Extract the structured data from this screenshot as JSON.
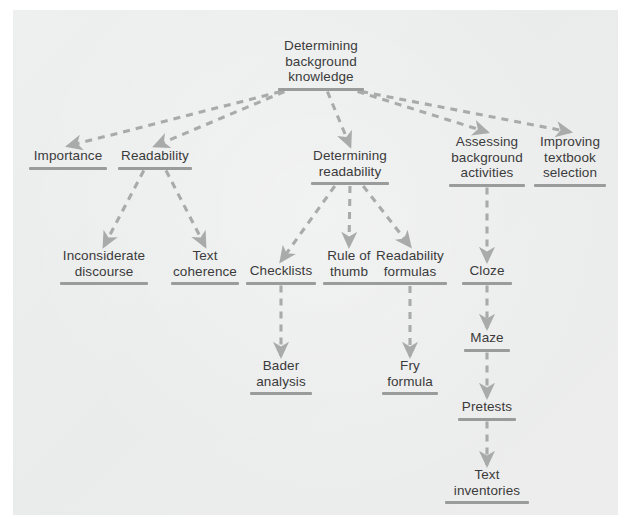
{
  "diagram": {
    "title_text": "Determining background knowledge",
    "type": "hierarchy-tree",
    "style": {
      "panel_bg": "#eceded",
      "page_bg": "#ffffff",
      "text_color": "#3b3b3b",
      "rule_color": "#9a9c9c",
      "connector_color": "#a9abab",
      "connector_style": "dashed-arrow"
    },
    "nodes": [
      {
        "id": "root",
        "label": "Determining\nbackground\nknowledge",
        "x": 321,
        "y": 38,
        "rule_w": 86
      },
      {
        "id": "importance",
        "label": "Importance",
        "x": 68,
        "y": 148,
        "rule_w": 78
      },
      {
        "id": "readability",
        "label": "Readability",
        "x": 155,
        "y": 148,
        "rule_w": 74
      },
      {
        "id": "det_read",
        "label": "Determining\nreadability",
        "x": 350,
        "y": 148,
        "rule_w": 78
      },
      {
        "id": "assessing",
        "label": "Assessing\nbackground\nactivities",
        "x": 487,
        "y": 134,
        "rule_w": 76
      },
      {
        "id": "improving",
        "label": "Improving\ntextbook\nselection",
        "x": 570,
        "y": 134,
        "rule_w": 72
      },
      {
        "id": "inconsiderate",
        "label": "Inconsiderate\ndiscourse",
        "x": 104,
        "y": 248,
        "rule_w": 88
      },
      {
        "id": "text_coh",
        "label": "Text\ncoherence",
        "x": 205,
        "y": 248,
        "rule_w": 68
      },
      {
        "id": "checklists",
        "label": "Checklists",
        "x": 281,
        "y": 263,
        "rule_w": 70
      },
      {
        "id": "rule_thumb",
        "label": "Rule of\nthumb",
        "x": 349,
        "y": 248,
        "rule_w": 52
      },
      {
        "id": "read_form",
        "label": "Readability\nformulas",
        "x": 410,
        "y": 248,
        "rule_w": 74
      },
      {
        "id": "cloze",
        "label": "Cloze",
        "x": 487,
        "y": 263,
        "rule_w": 50
      },
      {
        "id": "bader",
        "label": "Bader\nanalysis",
        "x": 281,
        "y": 358,
        "rule_w": 62
      },
      {
        "id": "fry",
        "label": "Fry\nformula",
        "x": 410,
        "y": 358,
        "rule_w": 56
      },
      {
        "id": "maze",
        "label": "Maze",
        "x": 487,
        "y": 330,
        "rule_w": 46
      },
      {
        "id": "pretests",
        "label": "Pretests",
        "x": 487,
        "y": 399,
        "rule_w": 58
      },
      {
        "id": "text_inv",
        "label": "Text\ninventories",
        "x": 487,
        "y": 467,
        "rule_w": 84
      }
    ],
    "edges": [
      {
        "from": "root",
        "to": "importance"
      },
      {
        "from": "root",
        "to": "readability"
      },
      {
        "from": "root",
        "to": "det_read"
      },
      {
        "from": "root",
        "to": "assessing"
      },
      {
        "from": "root",
        "to": "improving"
      },
      {
        "from": "readability",
        "to": "inconsiderate"
      },
      {
        "from": "readability",
        "to": "text_coh"
      },
      {
        "from": "det_read",
        "to": "checklists"
      },
      {
        "from": "det_read",
        "to": "rule_thumb"
      },
      {
        "from": "det_read",
        "to": "read_form"
      },
      {
        "from": "checklists",
        "to": "bader"
      },
      {
        "from": "read_form",
        "to": "fry"
      },
      {
        "from": "assessing",
        "to": "cloze"
      },
      {
        "from": "cloze",
        "to": "maze"
      },
      {
        "from": "maze",
        "to": "pretests"
      },
      {
        "from": "pretests",
        "to": "text_inv"
      }
    ]
  }
}
